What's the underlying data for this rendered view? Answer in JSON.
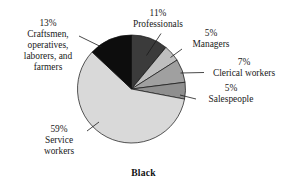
{
  "chart_data": {
    "type": "pie",
    "title": "Black",
    "xlabel": "",
    "ylabel": "",
    "legend_position": "none",
    "grid": false,
    "units": "percent",
    "categories": [
      "Professionals",
      "Managers",
      "Clerical workers",
      "Salespeople",
      "Service workers",
      "Craftsmen, operatives, laborers, and farmers"
    ],
    "values": [
      11,
      5,
      7,
      5,
      59,
      13
    ],
    "value_labels": [
      "11%",
      "5%",
      "7%",
      "5%",
      "59%",
      "13%"
    ],
    "colors": [
      "#3b3b3b",
      "#bfbfbf",
      "#a0a0a0",
      "#8f8f8f",
      "#d9d9d9",
      "#0d0d0d"
    ],
    "slices": [
      {
        "label": "Professionals",
        "value": 11,
        "value_label": "11%",
        "color": "#3b3b3b"
      },
      {
        "label": "Managers",
        "value": 5,
        "value_label": "5%",
        "color": "#bfbfbf"
      },
      {
        "label": "Clerical workers",
        "value": 7,
        "value_label": "7%",
        "color": "#a0a0a0"
      },
      {
        "label": "Salespeople",
        "value": 5,
        "value_label": "5%",
        "color": "#8f8f8f"
      },
      {
        "label": "Service workers",
        "value": 59,
        "value_label": "59%",
        "color": "#d9d9d9"
      },
      {
        "label": "Craftsmen, operatives, laborers, and farmers",
        "value": 13,
        "value_label": "13%",
        "color": "#0d0d0d"
      }
    ]
  },
  "labels": {
    "professionals": {
      "pct": "11%",
      "name": "Professionals"
    },
    "managers": {
      "pct": "5%",
      "name": "Managers"
    },
    "clerical": {
      "pct": "7%",
      "name": "Clerical workers"
    },
    "salespeople": {
      "pct": "5%",
      "name": "Salespeople"
    },
    "service": {
      "pct": "59%",
      "name_line1": "Service",
      "name_line2": "workers"
    },
    "craftsmen": {
      "pct": "13%",
      "name_line1": "Craftsmen,",
      "name_line2": "operatives,",
      "name_line3": "laborers, and",
      "name_line4": "farmers"
    }
  },
  "title": "Black"
}
